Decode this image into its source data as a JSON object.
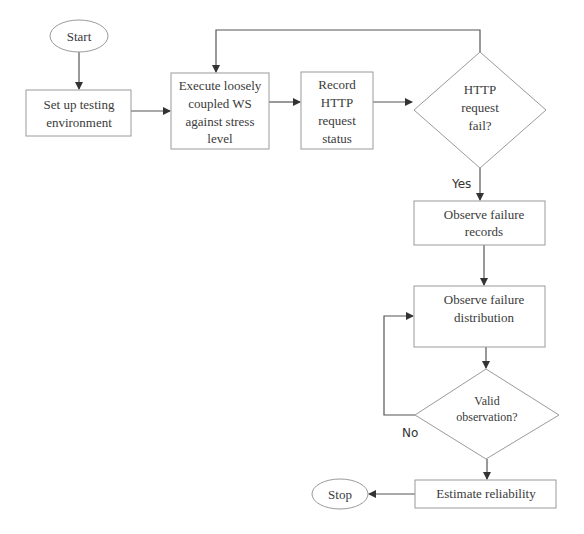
{
  "diagram": {
    "type": "flowchart",
    "nodes": {
      "start": {
        "label": "Start",
        "shape": "ellipse"
      },
      "setup": {
        "lines": [
          "Set up testing",
          "environment"
        ],
        "shape": "rect"
      },
      "execute": {
        "lines": [
          "Execute loosely",
          "coupled WS",
          "against stress",
          "level"
        ],
        "shape": "rect"
      },
      "record": {
        "lines": [
          "Record",
          "HTTP",
          "request",
          "status"
        ],
        "shape": "rect"
      },
      "http_fail": {
        "lines": [
          "HTTP",
          "request",
          "fail?"
        ],
        "shape": "diamond"
      },
      "observe_records": {
        "lines": [
          "Observe failure",
          "records"
        ],
        "shape": "rect"
      },
      "observe_distribution": {
        "lines": [
          "Observe failure",
          "distribution"
        ],
        "shape": "rect"
      },
      "valid_obs": {
        "lines": [
          "Valid",
          "observation?"
        ],
        "shape": "diamond"
      },
      "estimate": {
        "label": "Estimate reliability",
        "shape": "rect"
      },
      "stop": {
        "label": "Stop",
        "shape": "ellipse"
      }
    },
    "edges": [
      {
        "from": "start",
        "to": "setup"
      },
      {
        "from": "setup",
        "to": "execute"
      },
      {
        "from": "execute",
        "to": "record"
      },
      {
        "from": "record",
        "to": "http_fail"
      },
      {
        "from": "http_fail",
        "to": "execute",
        "label": ""
      },
      {
        "from": "http_fail",
        "to": "observe_records",
        "label": "Yes"
      },
      {
        "from": "observe_records",
        "to": "observe_distribution"
      },
      {
        "from": "observe_distribution",
        "to": "valid_obs"
      },
      {
        "from": "valid_obs",
        "to": "observe_distribution",
        "label": "No"
      },
      {
        "from": "valid_obs",
        "to": "estimate"
      },
      {
        "from": "estimate",
        "to": "stop"
      }
    ],
    "edge_labels": {
      "yes": "Yes",
      "no": "No"
    },
    "colors": {
      "shape_stroke": "#9a9a9a",
      "arrow": "#555555",
      "text": "#3a3a3a"
    }
  }
}
